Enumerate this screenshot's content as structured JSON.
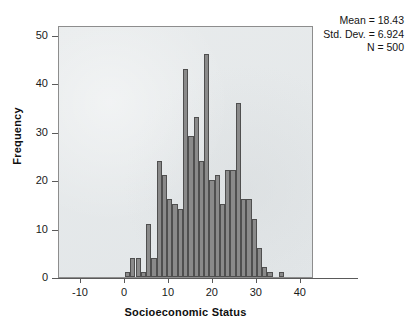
{
  "chart_data": {
    "type": "bar",
    "title": "",
    "subtitle": "",
    "xlabel": "Socioeconomic Status",
    "ylabel": "Frequency",
    "xlim": [
      -15,
      43
    ],
    "ylim": [
      0,
      52
    ],
    "xticks": [
      -10,
      0,
      10,
      20,
      30,
      40
    ],
    "yticks": [
      0,
      10,
      20,
      30,
      40,
      50
    ],
    "xtick_labels": [
      "-10",
      "0",
      "10",
      "20",
      "30",
      "40"
    ],
    "ytick_labels": [
      "0",
      "10",
      "20",
      "30",
      "40",
      "50"
    ],
    "grid": false,
    "legend": false,
    "bin_width": 1.2,
    "bar_color": "#8a8a8a",
    "bar_edge_color": "#4f4f4f",
    "plot_background": "#e8ebec",
    "categories": [
      "0.0",
      "1.2",
      "2.4",
      "3.6",
      "4.8",
      "6.0",
      "7.2",
      "8.4",
      "9.6",
      "10.8",
      "12.0",
      "13.2",
      "14.4",
      "15.6",
      "16.8",
      "18.0",
      "19.2",
      "20.4",
      "21.6",
      "22.8",
      "24.0",
      "25.2",
      "26.4",
      "27.6",
      "28.8",
      "30.0",
      "31.2",
      "32.4",
      "35.0"
    ],
    "values": [
      1,
      4,
      4,
      1,
      11,
      4,
      24,
      21,
      16,
      15,
      14,
      43,
      29,
      33,
      24,
      46,
      20,
      21,
      15,
      22,
      22,
      36,
      16,
      16,
      12,
      6,
      2,
      1,
      1
    ]
  },
  "stats": {
    "mean_label": "Mean = 18.43",
    "std_dev_label": "Std. Dev. = 6.924",
    "n_label": "N = 500"
  }
}
